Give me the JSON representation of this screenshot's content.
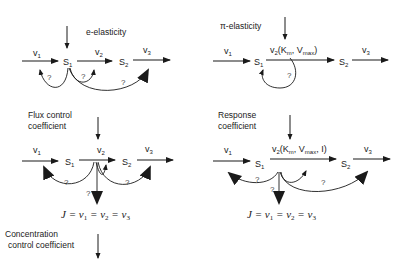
{
  "panels": {
    "e_elasticity": {
      "title": "e-elasticity",
      "v1": "v",
      "v1_sub": "1",
      "v2": "v",
      "v2_sub": "2",
      "v3": "v",
      "v3_sub": "3",
      "s1": "S",
      "s1_sub": "1",
      "s2": "S",
      "s2_sub": "2",
      "questions": [
        "?",
        "?",
        "?"
      ]
    },
    "pi_elasticity": {
      "title": "π-elasticity",
      "v1": "v",
      "v1_sub": "1",
      "v2_label": "v",
      "v2_sub": "2",
      "v2_params": "(K",
      "km_sub": "m",
      "vmax": ", V",
      "vmax_sub": "max",
      "close": ")",
      "v3": "v",
      "v3_sub": "3",
      "s1": "S",
      "s1_sub": "1",
      "s2": "S",
      "s2_sub": "2",
      "questions": [
        "?"
      ]
    },
    "flux_control": {
      "title_line1": "Flux control",
      "title_line2": "coefficient",
      "v1": "v",
      "v1_sub": "1",
      "v2": "v",
      "v2_sub": "2",
      "v3": "v",
      "v3_sub": "3",
      "s1": "S",
      "s1_sub": "1",
      "s2": "S",
      "s2_sub": "2",
      "questions": [
        "?",
        "?",
        "?"
      ],
      "equation": {
        "J": "J",
        "eq": " = ",
        "v": "v",
        "subs": [
          "1",
          "2",
          "3"
        ]
      }
    },
    "response_coefficient": {
      "title_line1": "Response",
      "title_line2": "coefficient",
      "v1": "v",
      "v1_sub": "1",
      "v2_label": "v",
      "v2_sub": "2",
      "v2_params": "(K",
      "km_sub": "m",
      "vmax": ", V",
      "vmax_sub": "max",
      "inhibitor": ", I)",
      "v3": "v",
      "v3_sub": "3",
      "s1": "S",
      "s1_sub": "1",
      "s2": "S",
      "s2_sub": "2",
      "questions": [
        "?",
        "?",
        "?"
      ],
      "equation": {
        "J": "J",
        "eq": " = ",
        "v": "v",
        "subs": [
          "1",
          "2",
          "3"
        ]
      }
    },
    "concentration_control": {
      "title_line1": "Concentration",
      "title_line2": "control coefficient"
    }
  },
  "colors": {
    "stroke": "#1a1a1a",
    "text": "#222222",
    "background": "#ffffff"
  }
}
